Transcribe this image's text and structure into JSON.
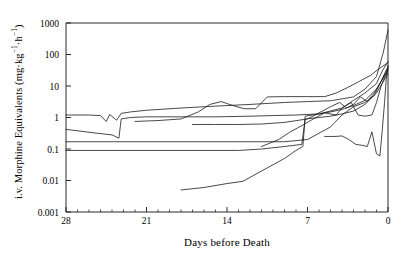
{
  "chart_data": {
    "type": "line",
    "title": "",
    "xlabel": "Days before Death",
    "ylabel": "i.v. Morphine Equivalents (mg·kg⁻¹·h⁻¹)",
    "ylabel_plain": "i.v. Morphine Equivalents",
    "ylabel_units_main": "mg",
    "ylabel_units_kg": "kg",
    "ylabel_units_h": "h",
    "yscale": "log",
    "ylim": [
      0.001,
      1000
    ],
    "ytick_labels": [
      "1000",
      "100",
      "10",
      "1",
      "0.1",
      "0.01",
      "0.001"
    ],
    "ytick_values": [
      1000,
      100,
      10,
      1,
      0.1,
      0.01,
      0.001
    ],
    "xlim": [
      28,
      0
    ],
    "x_reversed": true,
    "xtick_labels": [
      "28",
      "21",
      "14",
      "7",
      "0"
    ],
    "xtick_values": [
      28,
      21,
      14,
      7,
      0
    ],
    "x_minor_tick_step": 1,
    "grid": false,
    "legend": "none",
    "line_color": "#1a1a1a",
    "line_width": 0.8,
    "axis_color": "#2a2a2a",
    "background": "#ffffff",
    "n_series": 9,
    "series": [
      {
        "name": "patient-1",
        "points": [
          [
            28,
            1.2
          ],
          [
            26,
            1.2
          ],
          [
            25,
            1.15
          ],
          [
            24.5,
            0.75
          ],
          [
            24.2,
            1.25
          ],
          [
            23.6,
            0.82
          ],
          [
            23.2,
            1.35
          ],
          [
            22.4,
            1.5
          ],
          [
            21,
            1.7
          ],
          [
            18,
            2.0
          ],
          [
            15,
            2.3
          ],
          [
            12,
            2.6
          ],
          [
            9,
            3.0
          ],
          [
            7,
            3.2
          ],
          [
            5,
            3.4
          ],
          [
            3,
            4.5
          ],
          [
            2,
            8
          ],
          [
            1,
            20
          ],
          [
            0.4,
            120
          ],
          [
            0,
            600
          ]
        ]
      },
      {
        "name": "patient-2",
        "points": [
          [
            28,
            0.42
          ],
          [
            26,
            0.34
          ],
          [
            24,
            0.28
          ],
          [
            23.4,
            0.22
          ],
          [
            23.2,
            0.9
          ],
          [
            22.4,
            1.0
          ],
          [
            21,
            1.05
          ],
          [
            18,
            1.05
          ],
          [
            15,
            1.05
          ],
          [
            12,
            1.1
          ],
          [
            10,
            1.15
          ],
          [
            8,
            1.2
          ],
          [
            6,
            1.3
          ],
          [
            4,
            2.0
          ],
          [
            3,
            3.5
          ],
          [
            2,
            6
          ],
          [
            1,
            12
          ],
          [
            0.5,
            30
          ],
          [
            0,
            60
          ]
        ]
      },
      {
        "name": "patient-3",
        "points": [
          [
            28,
            0.17
          ],
          [
            22,
            0.17
          ],
          [
            16,
            0.17
          ],
          [
            12,
            0.17
          ],
          [
            9,
            0.17
          ],
          [
            7,
            0.2
          ],
          [
            5,
            0.5
          ],
          [
            4,
            1.2
          ],
          [
            3,
            2.2
          ],
          [
            2,
            3.0
          ],
          [
            1.2,
            5
          ],
          [
            0.6,
            14
          ],
          [
            0,
            40
          ]
        ]
      },
      {
        "name": "patient-4",
        "points": [
          [
            28,
            0.09
          ],
          [
            24,
            0.09
          ],
          [
            20,
            0.09
          ],
          [
            16,
            0.09
          ],
          [
            13,
            0.09
          ],
          [
            11,
            0.1
          ],
          [
            9,
            0.12
          ],
          [
            7.5,
            0.14
          ],
          [
            7.2,
            0.9
          ],
          [
            6,
            1.0
          ],
          [
            5,
            1.1
          ],
          [
            4,
            1.3
          ],
          [
            3,
            1.6
          ],
          [
            2,
            2.6
          ],
          [
            1,
            6
          ],
          [
            0.5,
            12
          ],
          [
            0,
            25
          ]
        ]
      },
      {
        "name": "patient-5",
        "points": [
          [
            18,
            0.005
          ],
          [
            16,
            0.006
          ],
          [
            14,
            0.008
          ],
          [
            13,
            0.009
          ],
          [
            12.6,
            0.0095
          ],
          [
            11,
            0.02
          ],
          [
            9,
            0.05
          ],
          [
            8,
            0.09
          ],
          [
            7.4,
            0.12
          ],
          [
            7.2,
            1.1
          ],
          [
            6,
            1.3
          ],
          [
            5,
            1.5
          ],
          [
            4,
            1.8
          ],
          [
            3,
            2.4
          ],
          [
            2,
            3.5
          ],
          [
            1,
            8
          ],
          [
            0.5,
            16
          ],
          [
            0,
            30
          ]
        ]
      },
      {
        "name": "patient-6",
        "points": [
          [
            22,
            0.75
          ],
          [
            20,
            0.8
          ],
          [
            18,
            0.9
          ],
          [
            16.5,
            1.5
          ],
          [
            15.5,
            2.6
          ],
          [
            14.5,
            3.2
          ],
          [
            13.5,
            2.4
          ],
          [
            12.5,
            1.9
          ],
          [
            11.5,
            1.9
          ],
          [
            10.5,
            4.5
          ],
          [
            9,
            4.6
          ],
          [
            7,
            4.6
          ],
          [
            5.5,
            4.6
          ],
          [
            4.5,
            6
          ],
          [
            3.5,
            9
          ],
          [
            2.5,
            14
          ],
          [
            1.5,
            22
          ],
          [
            0.8,
            35
          ],
          [
            0,
            55
          ]
        ]
      },
      {
        "name": "patient-7",
        "points": [
          [
            17,
            0.6
          ],
          [
            15,
            0.6
          ],
          [
            13,
            0.6
          ],
          [
            11,
            0.62
          ],
          [
            9,
            0.7
          ],
          [
            7,
            0.9
          ],
          [
            6,
            1.4
          ],
          [
            5,
            2.2
          ],
          [
            4.2,
            3.0
          ],
          [
            3.6,
            2.0
          ],
          [
            3,
            2.6
          ],
          [
            2.4,
            4.5
          ],
          [
            1.8,
            3.2
          ],
          [
            1.2,
            6
          ],
          [
            0.6,
            14
          ],
          [
            0,
            40
          ]
        ]
      },
      {
        "name": "patient-8",
        "points": [
          [
            11,
            0.12
          ],
          [
            9.5,
            0.2
          ],
          [
            8.5,
            0.35
          ],
          [
            7.5,
            0.55
          ],
          [
            6.5,
            0.9
          ],
          [
            5.5,
            1.4
          ],
          [
            4.5,
            1.2
          ],
          [
            4,
            2.0
          ],
          [
            3.2,
            3.0
          ],
          [
            2.6,
            1.2
          ],
          [
            2,
            1.1
          ],
          [
            1.4,
            1.2
          ],
          [
            1,
            3
          ],
          [
            0.6,
            10
          ],
          [
            0,
            35
          ]
        ]
      },
      {
        "name": "patient-9",
        "points": [
          [
            5.5,
            0.25
          ],
          [
            4.6,
            0.25
          ],
          [
            4,
            0.26
          ],
          [
            3.4,
            0.2
          ],
          [
            2.8,
            0.14
          ],
          [
            2.2,
            0.13
          ],
          [
            1.8,
            0.12
          ],
          [
            1.4,
            0.35
          ],
          [
            1.0,
            0.07
          ],
          [
            0.7,
            0.06
          ],
          [
            0.5,
            0.4
          ],
          [
            0.3,
            3
          ],
          [
            0.15,
            18
          ],
          [
            0,
            45
          ]
        ]
      }
    ]
  },
  "plot_geometry": {
    "left": 66,
    "right": 388,
    "top": 23,
    "bottom": 212
  }
}
